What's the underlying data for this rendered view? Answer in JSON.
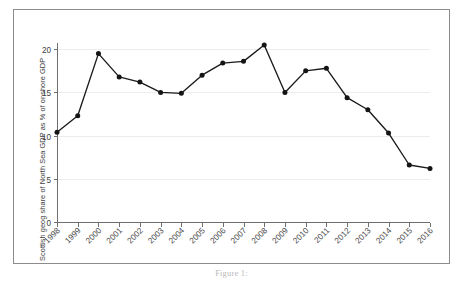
{
  "figure": {
    "caption": "Figure 1:"
  },
  "chart_data": {
    "type": "line",
    "title": "",
    "subtitle": "",
    "xlabel": "",
    "ylabel": "Scottish geog share of North Sea GDP as % of onshore GDP",
    "categories": [
      "1998",
      "1999",
      "2000",
      "2001",
      "2002",
      "2003",
      "2004",
      "2005",
      "2006",
      "2007",
      "2008",
      "2009",
      "2010",
      "2011",
      "2012",
      "2013",
      "2014",
      "2015",
      "2016"
    ],
    "values": [
      10.4,
      12.3,
      19.5,
      16.8,
      16.2,
      15.0,
      14.9,
      17.0,
      18.4,
      18.6,
      20.5,
      15.0,
      17.5,
      17.8,
      14.4,
      13.0,
      10.3,
      6.6,
      6.2
    ],
    "series": [
      {
        "name": "Scottish geographic share of North Sea GDP",
        "values": [
          10.4,
          12.3,
          19.5,
          16.8,
          16.2,
          15.0,
          14.9,
          17.0,
          18.4,
          18.6,
          20.5,
          15.0,
          17.5,
          17.8,
          14.4,
          13.0,
          10.3,
          6.6,
          6.2
        ]
      }
    ],
    "ylim": [
      0,
      22
    ],
    "yticks": [
      0,
      5,
      10,
      15,
      20
    ],
    "ytick_labels": [
      "0",
      "5",
      "10",
      "15",
      "20"
    ],
    "xtick_labels": [
      "1998",
      "1999",
      "2000",
      "2001",
      "2002",
      "2003",
      "2004",
      "2005",
      "2006",
      "2007",
      "2008",
      "2009",
      "2010",
      "2011",
      "2012",
      "2013",
      "2014",
      "2015",
      "2016"
    ],
    "grid": true,
    "legend": false,
    "legend_position": "none",
    "marker": "circle",
    "line_color": "#1a1a1a",
    "marker_color": "#141414",
    "grid_color": "#ededed",
    "axis_color": "#6f6f6f"
  }
}
